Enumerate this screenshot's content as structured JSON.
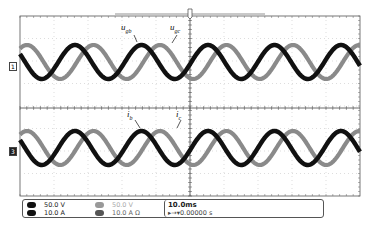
{
  "figure": {
    "type": "oscilloscope-capture",
    "top_panel": {
      "channel_marker": "1",
      "traces": [
        {
          "name": "u_gb",
          "label_main": "u",
          "label_sub": "gb",
          "color": "#111111"
        },
        {
          "name": "u_gc",
          "label_main": "u",
          "label_sub": "gc",
          "color": "#8a8a8a"
        }
      ]
    },
    "bottom_panel": {
      "channel_marker": "3",
      "traces": [
        {
          "name": "i_b",
          "label_main": "i",
          "label_sub": "b",
          "color": "#111111"
        },
        {
          "name": "i_c",
          "label_main": "i",
          "label_sub": "c",
          "color": "#8a8a8a"
        }
      ]
    },
    "trigger_marker": "T"
  },
  "readout": {
    "channels": [
      {
        "id": "1",
        "scale": "50.0 V",
        "active": true
      },
      {
        "id": "2",
        "scale": "50.0 V",
        "active": false
      },
      {
        "id": "3",
        "scale": "10.0 A",
        "active": true
      },
      {
        "id": "4",
        "scale": "10.0 A Ω",
        "active": true
      }
    ],
    "timebase": "10.0ms",
    "trigger_position": "▸→▾0.00000 s"
  },
  "chart_data": {
    "type": "line",
    "title": "",
    "xlabel": "time (10.0 ms/div)",
    "panels": [
      {
        "ylabel": "Voltage (50.0 V/div)",
        "series": [
          {
            "name": "u_gb",
            "shape": "sinusoid",
            "periods_visible": 5.1,
            "amplitude_div": 1.0,
            "phase_order": "lags u_gc by ~240deg (black)"
          },
          {
            "name": "u_gc",
            "shape": "sinusoid",
            "periods_visible": 5.1,
            "amplitude_div": 1.0
          }
        ]
      },
      {
        "ylabel": "Current (10.0 A/div)",
        "series": [
          {
            "name": "i_b",
            "shape": "sinusoid",
            "periods_visible": 5.1,
            "amplitude_div": 1.0
          },
          {
            "name": "i_c",
            "shape": "sinusoid",
            "periods_visible": 5.1,
            "amplitude_div": 1.0
          }
        ]
      }
    ],
    "grid": true,
    "horizontal_divisions": 10,
    "time_per_div": "10.0ms"
  }
}
